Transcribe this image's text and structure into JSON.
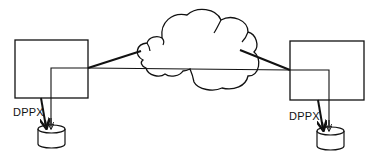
{
  "diagram": {
    "type": "network-topology",
    "nodes": [
      {
        "id": "left-system",
        "shape": "rectangle",
        "label": ""
      },
      {
        "id": "network-cloud",
        "shape": "cloud",
        "label": ""
      },
      {
        "id": "right-system",
        "shape": "rectangle",
        "label": ""
      },
      {
        "id": "left-storage",
        "shape": "cylinder",
        "label": ""
      },
      {
        "id": "right-storage",
        "shape": "cylinder",
        "label": ""
      }
    ],
    "edges": [
      {
        "from": "left-system",
        "to": "network-cloud",
        "style": "thick"
      },
      {
        "from": "network-cloud",
        "to": "right-system",
        "style": "thick"
      },
      {
        "from": "left-system",
        "to": "right-system",
        "style": "thin",
        "through": "network-cloud"
      },
      {
        "from": "left-system",
        "to": "left-storage",
        "style": "thick",
        "label": "DPPX"
      },
      {
        "from": "right-system",
        "to": "left-storage",
        "style": "thin-arrow"
      },
      {
        "from": "right-system",
        "to": "right-storage",
        "style": "thick",
        "label": "DPPX"
      },
      {
        "from": "left-system",
        "to": "right-storage",
        "style": "thin-arrow"
      }
    ]
  },
  "labels": {
    "left_dppx": "DPPX",
    "right_dppx": "DPPX"
  },
  "colors": {
    "stroke": "#111111",
    "background": "#ffffff"
  }
}
